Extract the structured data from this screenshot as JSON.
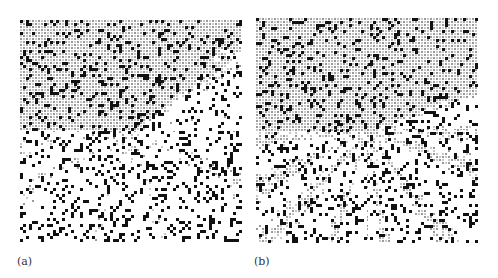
{
  "figure": {
    "panels": [
      {
        "id": "a",
        "label": "(a)",
        "description": "Sparse random black cell pattern with faint gray radial streaks from center",
        "density_black": 0.17,
        "gray_intensity": 0.25,
        "ray_count": 10
      },
      {
        "id": "b",
        "label": "(b)",
        "description": "Dense pattern with prominent gray hatched radial streaks emanating from center",
        "density_black": 0.16,
        "gray_intensity": 0.85,
        "ray_count": 14
      }
    ],
    "colors": {
      "black": "#111111",
      "gray": "#9a9a9a",
      "light_gray": "#c8c8c8",
      "background": "#ffffff"
    }
  }
}
